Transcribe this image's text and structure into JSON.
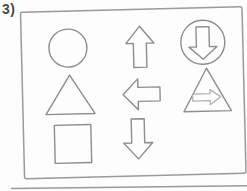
{
  "item_label": "3)",
  "panel": {
    "description": "bordered panel containing a 3x3 arrangement of outlined shapes",
    "grid": [
      [
        {
          "name": "circle-outline"
        },
        {
          "name": "up-arrow-outline"
        },
        {
          "name": "down-arrow-in-circle"
        }
      ],
      [
        {
          "name": "triangle-outline"
        },
        {
          "name": "left-arrow-outline"
        },
        {
          "name": "right-arrow-in-triangle"
        }
      ],
      [
        {
          "name": "square-outline"
        },
        {
          "name": "down-arrow-outline"
        },
        null
      ]
    ]
  },
  "colors": {
    "shape_outline": "#8d8d8d",
    "inner_arrow": "#b3b3b3",
    "frame_border": "#9a9a9a",
    "label_text": "#4a4a4a",
    "background": "#fdfdfd"
  }
}
